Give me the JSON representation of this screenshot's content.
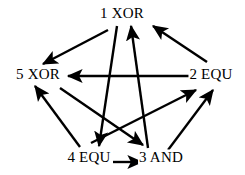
{
  "figure": {
    "name": "directed-graph-diagram",
    "background_color": "#ffffff",
    "stroke_color": "#000000",
    "width": 245,
    "height": 175
  },
  "nodes": [
    {
      "id": "1",
      "label": "1 XOR",
      "x": 122,
      "y": 13
    },
    {
      "id": "5",
      "label": "5 XOR",
      "x": 38,
      "y": 74
    },
    {
      "id": "2",
      "label": "2 EQU",
      "x": 211,
      "y": 74
    },
    {
      "id": "4",
      "label": "4 EQU",
      "x": 89,
      "y": 157
    },
    {
      "id": "3",
      "label": "3 AND",
      "x": 161,
      "y": 157
    }
  ],
  "edges": [
    {
      "name": "edge-1-to-5",
      "from": "1",
      "to": "5",
      "x1": 108,
      "y1": 30,
      "x2": 43,
      "y2": 64
    },
    {
      "name": "edge-1-to-4",
      "from": "1",
      "to": "4",
      "x1": 117,
      "y1": 26,
      "x2": 99,
      "y2": 146
    },
    {
      "name": "edge-2-to-1",
      "from": "2",
      "to": "1",
      "x1": 207,
      "y1": 62,
      "x2": 153,
      "y2": 26
    },
    {
      "name": "edge-2-to-5",
      "from": "2",
      "to": "5",
      "x1": 193,
      "y1": 76,
      "x2": 68,
      "y2": 76
    },
    {
      "name": "edge-3-to-1",
      "from": "3",
      "to": "1",
      "x1": 148,
      "y1": 148,
      "x2": 131,
      "y2": 26
    },
    {
      "name": "edge-5-to-3",
      "from": "5",
      "to": "3",
      "x1": 60,
      "y1": 88,
      "x2": 143,
      "y2": 145
    },
    {
      "name": "edge-4-to-5",
      "from": "4",
      "to": "5",
      "x1": 80,
      "y1": 147,
      "x2": 35,
      "y2": 86
    },
    {
      "name": "edge-4-to-3",
      "from": "4",
      "to": "3",
      "x1": 113,
      "y1": 162,
      "x2": 142,
      "y2": 162
    },
    {
      "name": "edge-4-to-2",
      "from": "4",
      "to": "2",
      "x1": 91,
      "y1": 143,
      "x2": 196,
      "y2": 90
    },
    {
      "name": "edge-3-to-2",
      "from": "3",
      "to": "2",
      "x1": 168,
      "y1": 150,
      "x2": 213,
      "y2": 90
    }
  ]
}
